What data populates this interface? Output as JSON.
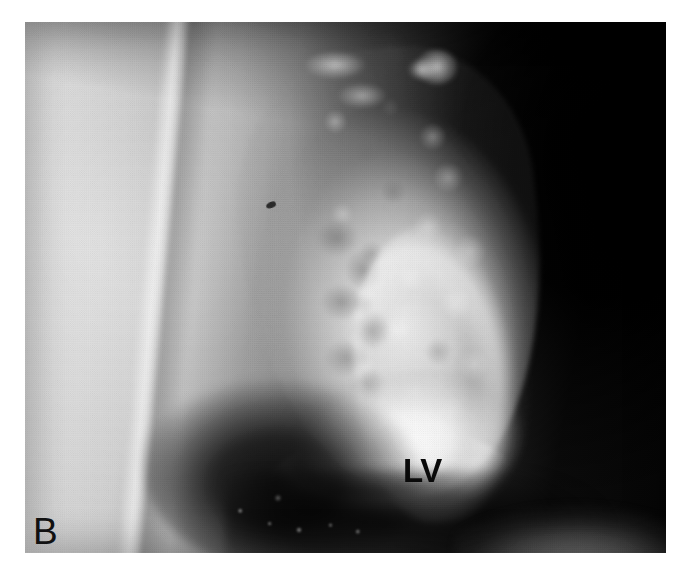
{
  "figure": {
    "panel_letter": "B",
    "modality": "left-ventriculogram",
    "view": "lateral projection",
    "plate": {
      "left": 25,
      "top": 22,
      "width": 641,
      "height": 531
    },
    "background_color": "#ffffff"
  },
  "annotations": [
    {
      "id": "lv-label",
      "text": "LV",
      "meaning": "left ventricle",
      "style": "bold",
      "color": "#0b0b0b",
      "x": 378,
      "y": 432
    },
    {
      "id": "panel-letter",
      "text": "B",
      "meaning": "figure panel identifier",
      "style": "regular",
      "color": "#111111",
      "x": 33,
      "y": 513
    }
  ],
  "regions": [
    {
      "name": "left-soft-tissue-field",
      "description": "bright homogeneous soft tissue / lung field on the left",
      "tone": "light-gray",
      "color": "#d5d5d5"
    },
    {
      "name": "sternum-stripe",
      "description": "bright near-vertical band running top to bottom, slightly tilted",
      "tone": "bright",
      "color": "#f2f2f2"
    },
    {
      "name": "opacified-lv-cavity",
      "description": "contrast-filled left ventricular cavity, pear shaped, coarsely trabeculated",
      "tone": "bright-mottled",
      "color": "#e8e8e8"
    },
    {
      "name": "lv-apex-pool",
      "description": "densest pool of contrast at the ventricular apex",
      "tone": "brightest",
      "color": "#fafafa"
    },
    {
      "name": "mid-cavity-filling-defect",
      "description": "serpiginous darker channel through the middle of the cavity",
      "tone": "mid-gray",
      "color": "#8c8c8c"
    },
    {
      "name": "outflow-tract",
      "description": "aortic root and outflow structures at the superior aspect",
      "tone": "mixed",
      "color": "#cfcfcf"
    },
    {
      "name": "right-lung-field",
      "description": "very dark posterior lung field occupying the right third",
      "tone": "black",
      "color": "#070707"
    },
    {
      "name": "diaphragm-gastric-shadow",
      "description": "dark region inferolaterally beneath the cardiac silhouette",
      "tone": "very-dark",
      "color": "#141414"
    },
    {
      "name": "lower-right-tissue",
      "description": "grey soft tissue dome rising at the lower-right corner",
      "tone": "mid-gray",
      "color": "#aaaaaa"
    },
    {
      "name": "marker-artifact",
      "description": "small dark speck artefact in the mid field",
      "tone": "black",
      "color": "#191919"
    }
  ],
  "palette": {
    "paper": "#ffffff",
    "film_light": "#d8d8d8",
    "film_mid": "#8a8a8a",
    "film_dark": "#222222",
    "film_black": "#070707",
    "contrast_bright": "#fafafa",
    "annotation_ink": "#0b0b0b"
  }
}
